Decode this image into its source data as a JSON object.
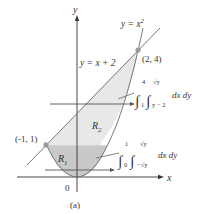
{
  "figure": {
    "caption": "(a)",
    "axes": {
      "x_label": "x",
      "y_label": "y",
      "origin_label": "0"
    },
    "curves": [
      {
        "name": "parabola",
        "label": "y = x",
        "exponent": "2"
      },
      {
        "name": "line",
        "label": "y = x + 2"
      }
    ],
    "points": [
      {
        "label": "(2, 4)",
        "x": 2,
        "y": 4
      },
      {
        "label": "(-1, 1)",
        "x": -1,
        "y": 1
      }
    ],
    "regions": [
      {
        "label": "R",
        "sub": "1",
        "color": "#c9c9c9"
      },
      {
        "label": "R",
        "sub": "2",
        "color": "#e8e8e8"
      }
    ],
    "integrals": [
      {
        "outer_upper": "4",
        "outer_lower": "1",
        "inner_upper": "√y",
        "inner_lower": "y − 2",
        "differentials": "dx dy"
      },
      {
        "outer_upper": "1",
        "outer_lower": "0",
        "inner_upper": "√y",
        "inner_lower": "−√y",
        "differentials": "dx dy"
      }
    ],
    "colors": {
      "line": "#777777",
      "axis": "#333333",
      "point": "#999999"
    }
  }
}
